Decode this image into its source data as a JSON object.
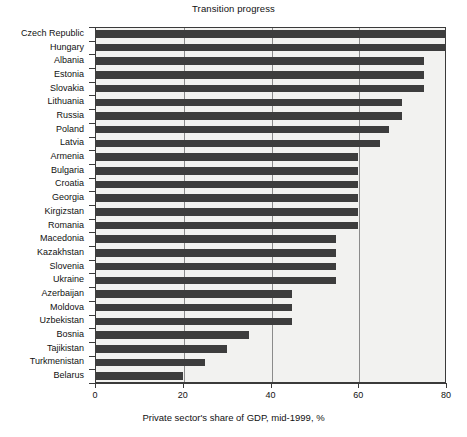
{
  "chart_data": {
    "type": "bar",
    "orientation": "horizontal",
    "title": "Transition progress",
    "xlabel": "Private sector's share of GDP, mid-1999, %",
    "ylabel": "",
    "xlim": [
      0,
      80
    ],
    "xticks": [
      0,
      20,
      40,
      60,
      80
    ],
    "xtick_labels": [
      "0",
      "20",
      "40",
      "60",
      "80"
    ],
    "grid": "vertical",
    "legend": "none",
    "bar_color": "#3d3d3d",
    "plot_background": "#f2f2f0",
    "categories": [
      "Czech Republic",
      "Hungary",
      "Albania",
      "Estonia",
      "Slovakia",
      "Lithuania",
      "Russia",
      "Poland",
      "Latvia",
      "Armenia",
      "Bulgaria",
      "Croatia",
      "Georgia",
      "Kirgizstan",
      "Romania",
      "Macedonia",
      "Kazakhstan",
      "Slovenia",
      "Ukraine",
      "Azerbaijan",
      "Moldova",
      "Uzbekistan",
      "Bosnia",
      "Tajikistan",
      "Turkmenistan",
      "Belarus"
    ],
    "values": [
      80,
      80,
      75,
      75,
      75,
      70,
      70,
      67,
      65,
      60,
      60,
      60,
      60,
      60,
      60,
      55,
      55,
      55,
      55,
      45,
      45,
      45,
      35,
      30,
      25,
      20
    ]
  }
}
